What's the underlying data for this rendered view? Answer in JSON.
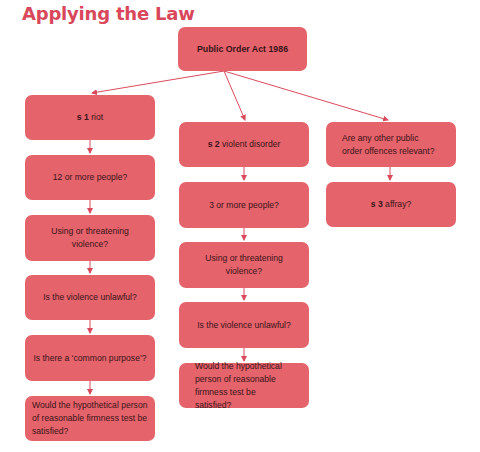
{
  "title": "Applying the Law",
  "colors": {
    "title": "#d9475a",
    "node_fill": "#e5636b",
    "node_text": "#3a1418",
    "arrow": "#d94a5a"
  },
  "root": {
    "label": "Public Order Act 1986"
  },
  "branches": [
    {
      "section": "s 1",
      "heading_rest": " riot",
      "steps": [
        "12 or more people?",
        "Using or threatening violence?",
        "Is the violence unlawful?",
        "Is there a ‘common purpose’?",
        "Would the hypothetical person of reasonable firmness test be satisfied?"
      ]
    },
    {
      "section": "s 2",
      "heading_rest": " violent disorder",
      "steps": [
        "3 or more people?",
        "Using or threatening violence?",
        "Is the violence unlawful?",
        "Would the hypothetical person of reasonable firmness test be satisfied?"
      ]
    },
    {
      "heading": "Are any other public order offences relevant?",
      "steps": [
        {
          "section": "s 3",
          "rest": " affray?"
        }
      ]
    }
  ]
}
